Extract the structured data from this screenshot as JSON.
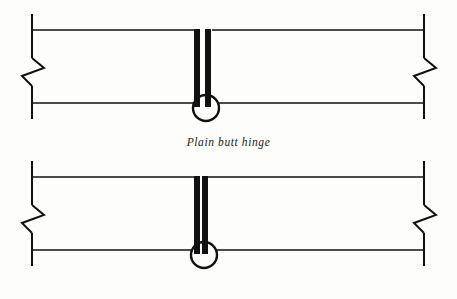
{
  "page": {
    "background_color": "#fdfdfb",
    "ink_color": "#111111",
    "width": 457,
    "height": 299
  },
  "figures": [
    {
      "id": "plain-butt-hinge",
      "caption": "Plain butt hinge",
      "hinge_type": "plain",
      "leaf_gap_px": 5,
      "geometry": {
        "left_edge_x": 32,
        "right_edge_x": 424,
        "top_rail_y": 30,
        "bottom_rail_y": 103,
        "edge_top_y": 14,
        "edge_bottom_y": 119,
        "break_symbol_y": 67,
        "center_x": 206,
        "leaf_width_px": 6,
        "pin_circle_cx": 206,
        "pin_circle_cy": 108,
        "pin_circle_r": 13
      }
    },
    {
      "id": "swaged-butt-hinge",
      "caption": "Swaged butt hinge",
      "hinge_type": "swaged",
      "leaf_gap_px": 2,
      "geometry": {
        "left_edge_x": 32,
        "right_edge_x": 424,
        "top_rail_y": 30,
        "bottom_rail_y": 103,
        "edge_top_y": 14,
        "edge_bottom_y": 119,
        "break_symbol_y": 67,
        "center_x": 204,
        "leaf_width_px": 6,
        "pin_circle_cx": 204,
        "pin_circle_cy": 108,
        "pin_circle_r": 13
      }
    }
  ],
  "symbols": {
    "break_line": "break-line-zigzag",
    "hinge_pin": "hinge-pin-circle",
    "hinge_leaf": "hinge-leaf-bar",
    "door_rail": "door-rail-line",
    "door_edge": "door-edge-line"
  }
}
